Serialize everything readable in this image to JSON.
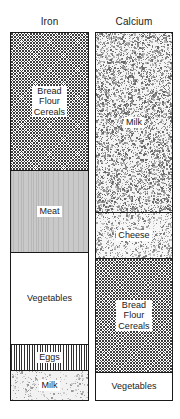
{
  "chart_data": {
    "type": "bar",
    "title": "",
    "subtitle": "",
    "xlabel": "",
    "ylabel": "",
    "stacked": true,
    "orientation": "vertical",
    "value_unit": "percent of total intake",
    "axis_visible": false,
    "grid": false,
    "legend": "none (segments labelled in place)",
    "ylim": [
      0,
      100
    ],
    "categories": [
      "Iron",
      "Calcium"
    ],
    "series": [
      {
        "name": "Bread Flour Cereals",
        "values": [
          38,
          31
        ],
        "pattern": "crosshatch"
      },
      {
        "name": "Meat",
        "values": [
          22,
          0
        ],
        "pattern": "gray-grain"
      },
      {
        "name": "Vegetables",
        "values": [
          25,
          8
        ],
        "pattern": "white"
      },
      {
        "name": "Eggs",
        "values": [
          7,
          0
        ],
        "pattern": "vertical-hatch"
      },
      {
        "name": "Milk",
        "values": [
          8,
          49
        ],
        "pattern": "speckle"
      },
      {
        "name": "Cheese",
        "values": [
          0,
          12
        ],
        "pattern": "speckle-light"
      }
    ],
    "bars": [
      {
        "category": "Iron",
        "label": "Iron",
        "segments": [
          {
            "label": "Bread\nFlour\nCereals",
            "name": "Bread Flour Cereals",
            "value": 38,
            "pattern": "crosshatch"
          },
          {
            "label": "Meat",
            "name": "Meat",
            "value": 22,
            "pattern": "gray-grain"
          },
          {
            "label": "Vegetables",
            "name": "Vegetables",
            "value": 25,
            "pattern": "white"
          },
          {
            "label": "Eggs",
            "name": "Eggs",
            "value": 7,
            "pattern": "vertical-hatch"
          },
          {
            "label": "Milk",
            "name": "Milk",
            "value": 8,
            "pattern": "speckle-light"
          }
        ]
      },
      {
        "category": "Calcium",
        "label": "Calcium",
        "segments": [
          {
            "label": "Milk",
            "name": "Milk",
            "value": 49,
            "pattern": "speckle-dense"
          },
          {
            "label": "Cheese",
            "name": "Cheese",
            "value": 12,
            "pattern": "speckle-med"
          },
          {
            "label": "Bread\nFlour\nCereals",
            "name": "Bread Flour Cereals",
            "value": 31,
            "pattern": "crosshatch"
          },
          {
            "label": "Vegetables",
            "name": "Vegetables",
            "value": 8,
            "pattern": "white"
          }
        ]
      }
    ]
  },
  "columns": {
    "iron": {
      "title": "Iron",
      "segments": {
        "bread": "Bread\nFlour\nCereals",
        "meat": "Meat",
        "vegetables": "Vegetables",
        "eggs": "Eggs",
        "milk": "Milk"
      }
    },
    "calcium": {
      "title": "Calcium",
      "segments": {
        "milk": "Milk",
        "cheese": "Cheese",
        "bread": "Bread\nFlour\nCereals",
        "vegetables": "Vegetables"
      }
    }
  }
}
